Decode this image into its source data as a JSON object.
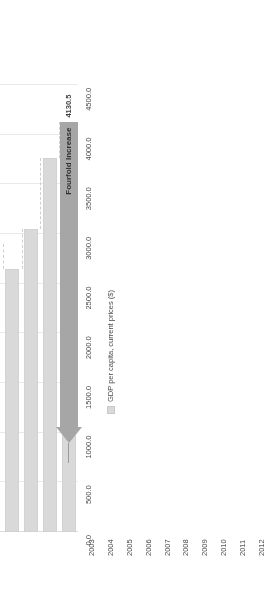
{
  "chart": {
    "type": "bar",
    "orientation": "vertical-bars-rotated",
    "axis_title": "USD",
    "legend_label": "GDP per capita, current prices ($)",
    "legend_marker": "square-swatch-icon",
    "annotation_text": "Fourfold Increase",
    "annotation_arrow": "left-arrow-icon",
    "bar_color": "#d9d9d9",
    "annotation_color": "#a6a6a6",
    "grid_color": "#e9e9e9"
  },
  "chart_data": {
    "type": "bar",
    "title": "",
    "xlabel": "",
    "ylabel": "USD",
    "ylim": [
      0,
      4750
    ],
    "grid": true,
    "legend_position": "bottom-right",
    "categories": [
      "2003",
      "2004",
      "2005",
      "2006",
      "2007",
      "2008",
      "2009",
      "2010",
      "2011",
      "2012"
    ],
    "values": [
      924.4,
      1150.0,
      1420.0,
      1830.0,
      2500.0,
      2900.0,
      2650.0,
      3050.0,
      3760.0,
      4130.5
    ],
    "series": [
      {
        "name": "GDP per capita, current prices ($)",
        "values": [
          924.4,
          1150.0,
          1420.0,
          1830.0,
          2500.0,
          2900.0,
          2650.0,
          3050.0,
          3760.0,
          4130.5
        ]
      }
    ],
    "tick_labels": [
      "0.0",
      "500.0",
      "1000.0",
      "1500.0",
      "2000.0",
      "2500.0",
      "3000.0",
      "3500.0",
      "4000.0",
      "4500.0"
    ],
    "tick_values": [
      0,
      500,
      1000,
      1500,
      2000,
      2500,
      3000,
      3500,
      4000,
      4500
    ],
    "data_labels": [
      {
        "category": "2003",
        "text": "924.4"
      },
      {
        "category": "2012",
        "text": "4130.5"
      }
    ],
    "annotations": [
      {
        "text": "Fourfold Increase",
        "type": "arrow",
        "points_to": "2012"
      }
    ]
  }
}
